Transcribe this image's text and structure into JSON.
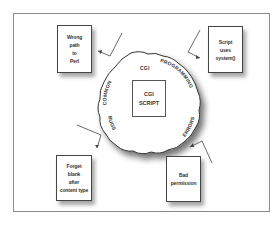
{
  "diagram": {
    "center": {
      "label": "CGI\nSCRIPT"
    },
    "ring_words": [
      {
        "id": "common",
        "text": "COMMON"
      },
      {
        "id": "cgi",
        "text": "CGI"
      },
      {
        "id": "programming",
        "text": "PROGRAMMING"
      },
      {
        "id": "errors",
        "text": "ERRORS"
      },
      {
        "id": "bugs",
        "text": "BUGS"
      }
    ],
    "boxes": [
      {
        "id": "wrong-path",
        "text": "Wrong\npath\nto\nPerl"
      },
      {
        "id": "script-system",
        "text": "Script\nuses\nsystem()"
      },
      {
        "id": "forget-blank",
        "text": "Forget\nblank\nafter\ncontent type"
      },
      {
        "id": "bad-permission",
        "text": "Bad\npermission"
      }
    ],
    "colors": {
      "stroke": "#444444",
      "frame": "#8a8a8a",
      "shadow": "#999999",
      "background": "#ffffff"
    }
  }
}
